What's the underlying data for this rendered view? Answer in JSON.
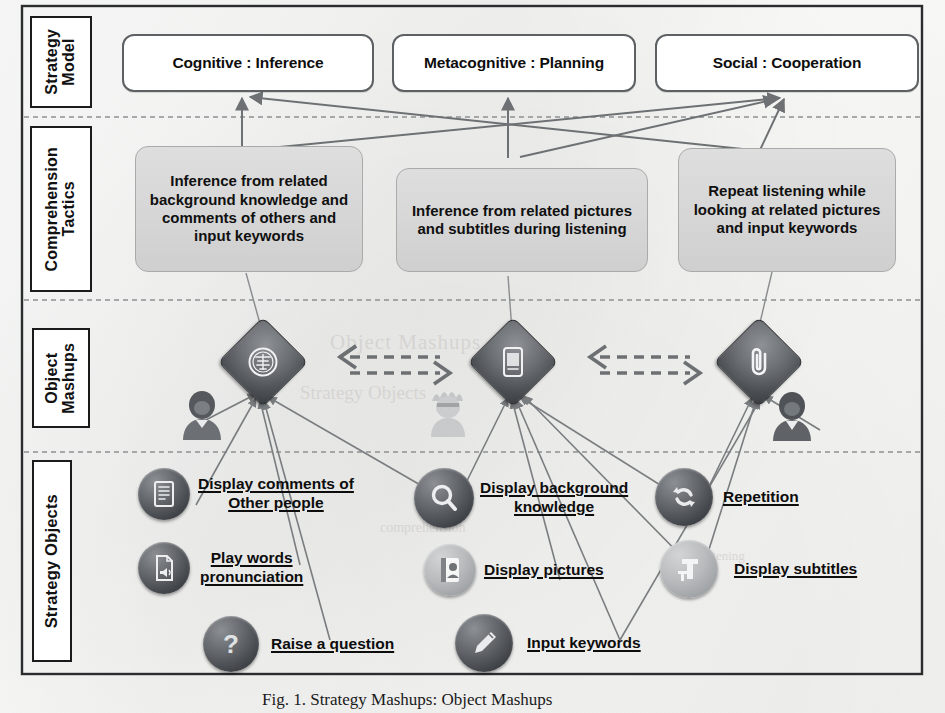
{
  "figure": {
    "caption": "Fig. 1. Strategy Mashups: Object Mashups",
    "rows": [
      {
        "id": "strategy-model",
        "label": "Strategy\nModel"
      },
      {
        "id": "comprehension-tactics",
        "label": "Comprehension\nTactics"
      },
      {
        "id": "object-mashups",
        "label": "Object\nMashups"
      },
      {
        "id": "strategy-objects",
        "label": "Strategy Objects"
      }
    ]
  },
  "strategy_model": {
    "boxes": [
      {
        "id": "cognitive",
        "label": "Cognitive : Inference"
      },
      {
        "id": "metacognitive",
        "label": "Metacognitive : Planning"
      },
      {
        "id": "social",
        "label": "Social : Cooperation"
      }
    ]
  },
  "comprehension_tactics": {
    "boxes": [
      {
        "id": "tactic-left",
        "label": "Inference from related background knowledge and comments of others and input keywords"
      },
      {
        "id": "tactic-middle",
        "label": "Inference from related pictures and subtitles during listening"
      },
      {
        "id": "tactic-right",
        "label": "Repeat listening while looking at related pictures and input keywords"
      }
    ]
  },
  "object_mashups": {
    "nodes": [
      {
        "id": "mashup-left",
        "icon": "stamp-seal-icon"
      },
      {
        "id": "mashup-middle",
        "icon": "mobile-document-icon"
      },
      {
        "id": "mashup-right",
        "icon": "paperclip-icon"
      }
    ],
    "connectors": [
      {
        "id": "connector-left-middle",
        "icon": "dashed-double-arrow-icon"
      },
      {
        "id": "connector-middle-right",
        "icon": "dashed-double-arrow-icon"
      }
    ],
    "people": [
      {
        "id": "person-left",
        "icon": "user-avatar-icon",
        "tone": "dark"
      },
      {
        "id": "person-middle",
        "icon": "user-avatar-hat-icon",
        "tone": "pale"
      },
      {
        "id": "person-right",
        "icon": "user-avatar-icon",
        "tone": "dark"
      }
    ]
  },
  "strategy_objects": {
    "items": [
      {
        "id": "display-comments",
        "icon": "comment-book-icon",
        "tone": "dark",
        "lines": [
          "Display comments of",
          "Other people"
        ]
      },
      {
        "id": "play-pronunciation",
        "icon": "audio-page-icon",
        "tone": "dark",
        "lines": [
          "Play words",
          "pronunciation"
        ]
      },
      {
        "id": "raise-question",
        "icon": "question-mark-icon",
        "tone": "dark",
        "lines": [
          "Raise a question"
        ]
      },
      {
        "id": "display-background",
        "icon": "magnifier-icon",
        "tone": "dark",
        "lines": [
          "Display background",
          "knowledge"
        ]
      },
      {
        "id": "display-pictures",
        "icon": "contact-card-icon",
        "tone": "pale",
        "lines": [
          "Display pictures"
        ]
      },
      {
        "id": "input-keywords",
        "icon": "pen-icon",
        "tone": "dark",
        "lines": [
          "Input keywords"
        ]
      },
      {
        "id": "repetition",
        "icon": "repeat-loop-icon",
        "tone": "dark",
        "lines": [
          "Repetition"
        ]
      },
      {
        "id": "display-subtitles",
        "icon": "text-tool-icon",
        "tone": "pale",
        "lines": [
          "Display subtitles"
        ]
      }
    ]
  },
  "colors": {
    "tactic_fill": "#d6d6d6",
    "model_border": "#5e6163",
    "arrow": "#6e7173",
    "rule": "#1b1b1b",
    "icon_dark": "#4a4d51",
    "icon_pale": "#b9bbbd"
  },
  "ghost_text": {
    "t1": "Fig. 1. Strategy Mashups: Object Mashups",
    "t2": "Strategy Objects",
    "t3": "Object Mashups",
    "t4": "comprehension",
    "t5": "listening"
  }
}
